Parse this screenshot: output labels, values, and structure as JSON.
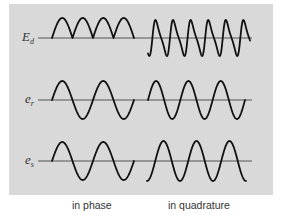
{
  "diagram": {
    "signals": [
      {
        "id": "Ed",
        "symbol": "E",
        "subscript": "d",
        "baseline_y": 38
      },
      {
        "id": "er",
        "symbol": "e",
        "subscript": "r",
        "baseline_y": 100
      },
      {
        "id": "es",
        "symbol": "e",
        "subscript": "s",
        "baseline_y": 161
      }
    ],
    "captions": {
      "left": "in phase",
      "right": "in quadrature"
    },
    "colors": {
      "panel": "#d9d9d9",
      "trace": "#111111",
      "axis": "#555555"
    }
  }
}
